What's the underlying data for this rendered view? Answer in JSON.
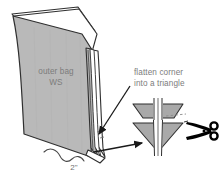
{
  "illustration": {
    "title": "Flatten corner into a triangle - outer bag sewing diagram",
    "background_color": "#ffffff",
    "fabric_fill": "#b9b9b9",
    "fabric_stroke": "#2f2f2f",
    "triangle_fill": "#a9a9a9",
    "seam_fill": "#ffffff",
    "text_color": "#7c7c7c",
    "arrow_color": "#1a1a1a",
    "scissors_color": "#000000"
  },
  "labels": {
    "outer_bag": "outer bag\nWS",
    "flatten_corner": "flatten corner\ninto a triangle",
    "measurement": "2\""
  },
  "icons": {
    "scissors": "scissors-icon",
    "arrow_to_corner": "arrow-icon",
    "arrow_to_triangle": "arrow-icon",
    "brace": "brace-icon"
  },
  "shapes": {
    "bag_body": "outer-bag-panel",
    "bag_fold": "bag-top-fold",
    "bag_spine": "bag-side-seam",
    "trapezoid": "flattened-corner-trapezoid",
    "triangle": "flattened-corner-triangle",
    "cut_line": "cut-guide-dashed-line"
  }
}
